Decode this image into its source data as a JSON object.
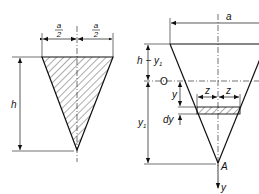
{
  "figure": {
    "left": {
      "title": "Triangular plate (vertex down)",
      "labels": {
        "half_width_left_num": "a",
        "half_width_left_den": "2",
        "half_width_right_num": "a",
        "half_width_right_den": "2",
        "height": "h"
      }
    },
    "right": {
      "title": "Triangular plate with strip element",
      "labels": {
        "width": "a",
        "upper_segment": "h − y",
        "upper_segment_sub": "1",
        "origin": "O",
        "y_coord": "y",
        "strip_half_left": "z",
        "strip_half_right": "z",
        "strip_thickness": "dy",
        "lower_segment": "y",
        "lower_segment_sub": "1",
        "apex": "A",
        "axis": "y"
      }
    },
    "colors": {
      "line": "#111111",
      "background": "#ffffff"
    }
  }
}
